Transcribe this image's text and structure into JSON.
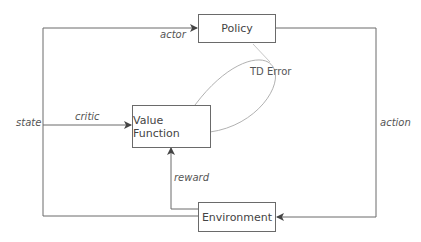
{
  "diagram": {
    "type": "actor-critic architecture",
    "nodes": [
      {
        "id": "policy",
        "label": "Policy"
      },
      {
        "id": "value_function",
        "label": "Value Function"
      },
      {
        "id": "environment",
        "label": "Environment"
      }
    ],
    "edges": [
      {
        "from": "environment",
        "to": "policy",
        "label": "actor"
      },
      {
        "from": "environment",
        "to": "value_function",
        "label": "critic"
      },
      {
        "from": "environment",
        "to": "value_function",
        "label": "reward"
      },
      {
        "from": "policy",
        "to": "environment",
        "label": "action"
      }
    ],
    "edge_labels": {
      "state": "state",
      "actor": "actor",
      "critic": "critic",
      "action": "action",
      "reward": "reward"
    },
    "annotation": {
      "label": "TD Error",
      "connects": [
        "value_function",
        "policy"
      ]
    }
  },
  "colors": {
    "line": "#6a6a6a",
    "ellipse": "#a0a0a0",
    "text": "#444444"
  }
}
